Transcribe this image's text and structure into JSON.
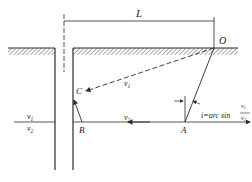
{
  "diagram": {
    "dimension_label": "L",
    "points": {
      "O": "O",
      "A": "A",
      "B": "B",
      "C": "C"
    },
    "velocities": {
      "upper": "v1",
      "lower": "v2",
      "upper_sub": "1",
      "lower_sub": "2",
      "v_letter": "v"
    },
    "angle_formula": {
      "prefix": "i=arc sin",
      "numerator": "v1",
      "denominator": "v2"
    },
    "colors": {
      "line": "#2a2a2a",
      "hatch": "#555555"
    }
  }
}
